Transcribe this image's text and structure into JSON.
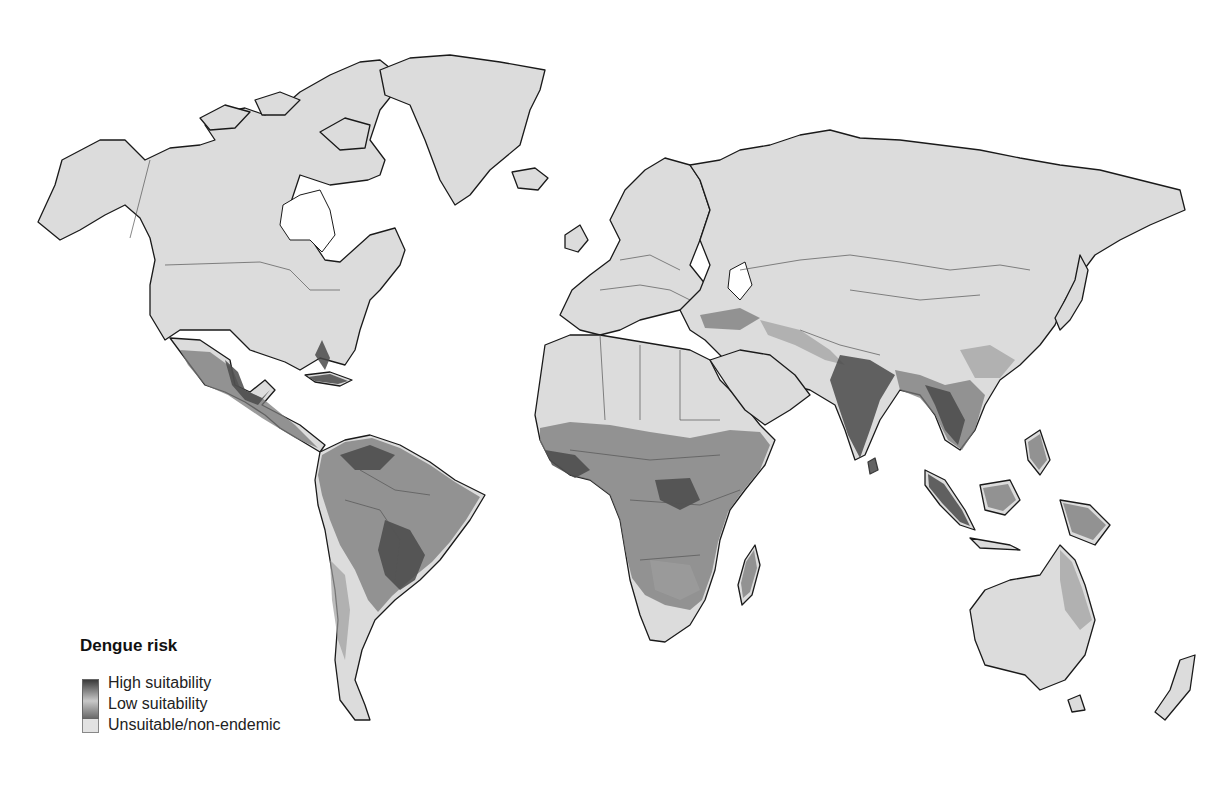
{
  "map": {
    "subject": "Global dengue risk suitability",
    "projection": "world equirectangular-like",
    "colors": {
      "land_unsuitable": "#dcdcdc",
      "ocean": "#ffffff",
      "high_suitability": "#3a3a3a",
      "low_suitability": "#9e9e9e",
      "outline": "#1a1a1a"
    },
    "risk_regions": [
      "Mexico and Central America",
      "Caribbean",
      "Northern and central South America",
      "Sub-Saharan Africa",
      "Madagascar",
      "Turkey / Anatolia",
      "South Asia (India, Bangladesh)",
      "Southeast Asia",
      "Indonesia, Philippines, Papua New Guinea",
      "Northeastern Australia",
      "Southern China"
    ]
  },
  "legend": {
    "title": "Dengue risk",
    "items": [
      {
        "label": "High suitability",
        "swatch": "gradient-dark"
      },
      {
        "label": "Low suitability",
        "swatch": "gradient-light"
      },
      {
        "label": "Unsuitable/non-endemic",
        "swatch": "solid-light"
      }
    ]
  }
}
